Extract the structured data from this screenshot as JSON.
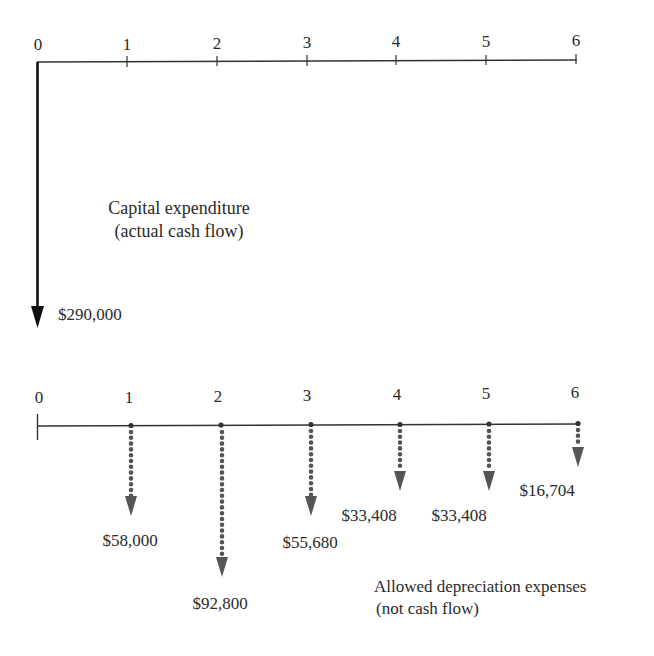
{
  "top_timeline": {
    "periods": [
      "0",
      "1",
      "2",
      "3",
      "4",
      "5",
      "6"
    ],
    "caption_line1": "Capital expenditure",
    "caption_line2": "(actual cash flow)",
    "cash_flow": {
      "period": "0",
      "amount": "$290,000",
      "direction": "down",
      "style": "solid"
    }
  },
  "bottom_timeline": {
    "periods": [
      "0",
      "1",
      "2",
      "3",
      "4",
      "5",
      "6"
    ],
    "caption_line1": "Allowed depreciation expenses",
    "caption_line2": "(not cash flow)",
    "flows": [
      {
        "period": "1",
        "amount": "$58,000"
      },
      {
        "period": "2",
        "amount": "$92,800"
      },
      {
        "period": "3",
        "amount": "$55,680"
      },
      {
        "period": "4",
        "amount": "$33,408"
      },
      {
        "period": "5",
        "amount": "$33,408"
      },
      {
        "period": "6",
        "amount": "$16,704"
      }
    ]
  },
  "colors": {
    "line": "#333333",
    "dotted_arrow": "#555555",
    "text": "#2a2a2a"
  }
}
